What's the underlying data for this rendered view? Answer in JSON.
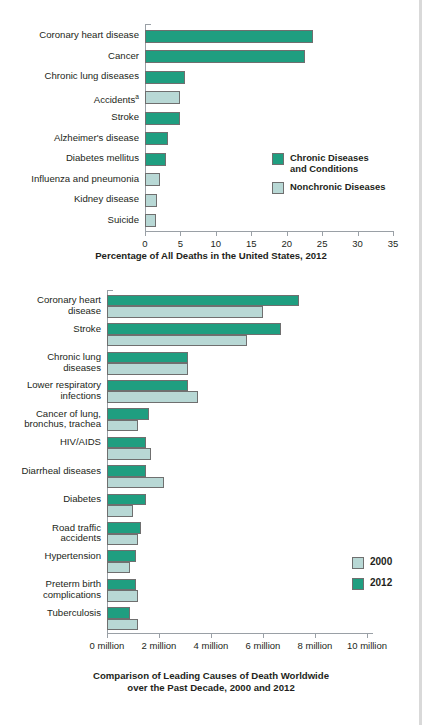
{
  "chart_data": [
    {
      "id": "us-deaths-2012",
      "type": "bar",
      "orientation": "horizontal",
      "title": "",
      "xlabel": "Percentage of All Deaths in the United States, 2012",
      "ylabel": "",
      "xlim": [
        0,
        35
      ],
      "xticks": [
        0,
        5,
        10,
        15,
        20,
        25,
        30,
        35
      ],
      "xtick_labels": [
        "0",
        "5",
        "10",
        "15",
        "20",
        "25",
        "30",
        "35"
      ],
      "grid": false,
      "legend_position": "middle-right",
      "categories": [
        "Coronary heart disease",
        "Cancer",
        "Chronic lung diseases",
        "Accidents",
        "Stroke",
        "Alzheimer's disease",
        "Diabetes mellitus",
        "Influenza and pneumonia",
        "Kidney disease",
        "Suicide"
      ],
      "category_footnotes": [
        "",
        "",
        "",
        "a",
        "",
        "",
        "",
        "",
        "",
        ""
      ],
      "values": [
        23.7,
        22.6,
        5.7,
        5.0,
        5.0,
        3.3,
        2.9,
        2.1,
        1.7,
        1.6
      ],
      "value_groups": [
        "chronic",
        "chronic",
        "chronic",
        "nonchronic",
        "chronic",
        "chronic",
        "chronic",
        "nonchronic",
        "nonchronic",
        "nonchronic"
      ],
      "legend": [
        {
          "key": "chronic",
          "label": "Chronic Diseases\nand Conditions",
          "color": "#1f9e80"
        },
        {
          "key": "nonchronic",
          "label": "Nonchronic Diseases",
          "color": "#b8d8d5"
        }
      ]
    },
    {
      "id": "worldwide-deaths-2000-2012",
      "type": "bar",
      "orientation": "horizontal",
      "title": "",
      "xlabel": "Comparison of Leading Causes of Death Worldwide\nover the Past Decade, 2000 and 2012",
      "ylabel": "",
      "xlim": [
        0,
        11
      ],
      "xticks": [
        0,
        2,
        4,
        6,
        8,
        10
      ],
      "xtick_labels": [
        "0 million",
        "2 million",
        "4 million",
        "6 million",
        "8 million",
        "10 million"
      ],
      "grid": false,
      "legend_position": "lower-right",
      "categories": [
        "Coronary heart\ndisease",
        "Stroke",
        "Chronic lung\ndiseases",
        "Lower respiratory\ninfections",
        "Cancer of lung,\nbronchus, trachea",
        "HIV/AIDS",
        "Diarrheal diseases",
        "Diabetes",
        "Road traffic\naccidents",
        "Hypertension",
        "Preterm birth\ncomplications",
        "Tuberculosis"
      ],
      "series": [
        {
          "name": "2012",
          "key": "y2012",
          "color": "#1f9e80",
          "values": [
            7.4,
            6.7,
            3.1,
            3.1,
            1.6,
            1.5,
            1.5,
            1.5,
            1.3,
            1.1,
            1.1,
            0.9
          ]
        },
        {
          "name": "2000",
          "key": "y2000",
          "color": "#b8d8d5",
          "values": [
            6.0,
            5.4,
            3.1,
            3.5,
            1.2,
            1.7,
            2.2,
            1.0,
            1.2,
            0.9,
            1.2,
            1.2
          ]
        }
      ],
      "legend": [
        {
          "key": "y2000",
          "label": "2000",
          "color": "#b8d8d5"
        },
        {
          "key": "y2012",
          "label": "2012",
          "color": "#1f9e80"
        }
      ]
    }
  ]
}
